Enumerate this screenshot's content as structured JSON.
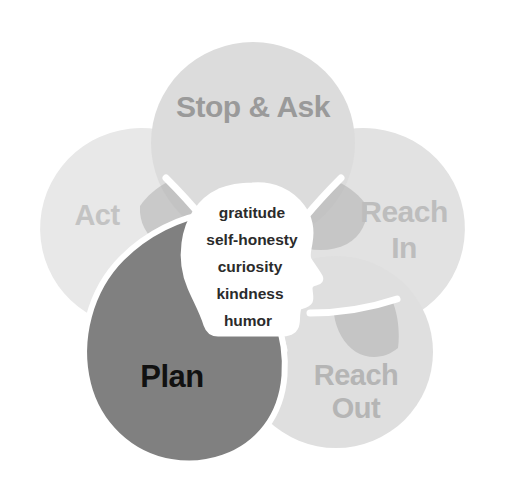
{
  "diagram": {
    "type": "petal-venn",
    "background_color": "#ffffff",
    "petals": [
      {
        "id": "stop-and-ask",
        "label": "Stop & Ask",
        "label_lines": [
          "Stop & Ask"
        ],
        "fill": "#dcdcdc",
        "text_color": "#9a9a9a",
        "position": "top",
        "font_size": 30
      },
      {
        "id": "reach-in",
        "label": "Reach In",
        "label_lines": [
          "Reach",
          "In"
        ],
        "fill": "#e2e2e2",
        "text_color": "#bdbdbd",
        "position": "right-upper",
        "font_size": 30
      },
      {
        "id": "reach-out",
        "label": "Reach Out",
        "label_lines": [
          "Reach",
          "Out"
        ],
        "fill": "#dfdfdf",
        "text_color": "#b5b5b5",
        "position": "right-lower",
        "font_size": 29
      },
      {
        "id": "plan",
        "label": "Plan",
        "label_lines": [
          "Plan"
        ],
        "fill": "#808080",
        "text_color": "#111111",
        "position": "left-lower",
        "font_size": 31
      },
      {
        "id": "act",
        "label": "Act",
        "label_lines": [
          "Act"
        ],
        "fill": "#e8e8e8",
        "text_color": "#c3c3c3",
        "position": "left-upper",
        "font_size": 29
      }
    ],
    "overlap_fill": "#c6c6c6",
    "divider_color": "#ffffff",
    "core": {
      "id": "head-silhouette",
      "shape": "human-head-profile-facing-right",
      "fill": "#ffffff",
      "words": [
        "gratitude",
        "self-honesty",
        "curiosity",
        "kindness",
        "humor"
      ],
      "word_color": "#2b2b2b"
    }
  }
}
